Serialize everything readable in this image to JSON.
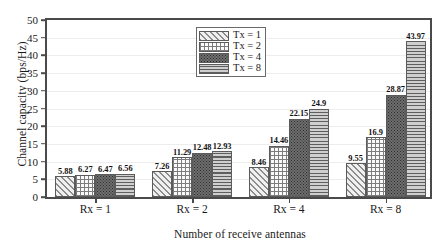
{
  "chart_data": {
    "type": "bar",
    "title": "",
    "xlabel": "Number of receive antennas",
    "ylabel": "Channel capacity (bps/Hz)",
    "categories": [
      "Rx = 1",
      "Rx = 2",
      "Rx = 4",
      "Rx = 8"
    ],
    "series": [
      {
        "name": "Tx = 1",
        "pattern": "diagonal-hatch",
        "values": [
          5.88,
          7.26,
          8.46,
          9.55
        ]
      },
      {
        "name": "Tx = 2",
        "pattern": "cross-grid",
        "values": [
          6.27,
          11.29,
          14.46,
          16.9
        ]
      },
      {
        "name": "Tx = 4",
        "pattern": "dense-dots",
        "values": [
          6.47,
          12.48,
          22.15,
          28.87
        ]
      },
      {
        "name": "Tx = 8",
        "pattern": "horizontal-lines",
        "values": [
          6.56,
          12.93,
          24.9,
          43.97
        ]
      }
    ],
    "value_labels": [
      [
        "5.88",
        "6.27",
        "6.47",
        "6.56"
      ],
      [
        "7.26",
        "11.29",
        "12.48",
        "12.93"
      ],
      [
        "8.46",
        "14.46",
        "22.15",
        "24.9"
      ],
      [
        "9.55",
        "16.9",
        "28.87",
        "43.97"
      ]
    ],
    "ylim": [
      0,
      50
    ],
    "ytick_values": [
      0,
      5,
      10,
      15,
      20,
      25,
      30,
      35,
      40,
      45,
      50
    ],
    "ytick_labels": [
      "0",
      "5",
      "10",
      "15",
      "20",
      "25",
      "30",
      "35",
      "40",
      "45",
      "50"
    ],
    "grid": true,
    "legend_position": "top-center",
    "legend_entries": [
      "Tx = 1",
      "Tx = 2",
      "Tx = 4",
      "Tx = 8"
    ],
    "colors": {
      "axis": "#4a4a4a",
      "gridline": "#ededed",
      "bar_outline": "#5b5b5b",
      "text": "#1a1a1a",
      "background": "#ffffff"
    }
  }
}
